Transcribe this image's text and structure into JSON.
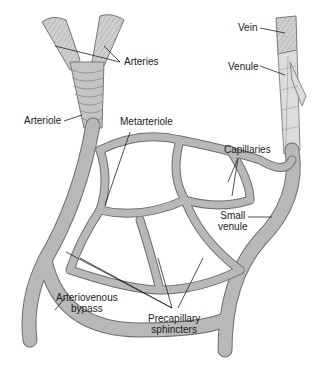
{
  "diagram": {
    "labels": {
      "arteries": "Arteries",
      "arteriole": "Arteriole",
      "metarteriole": "Metarteriole",
      "vein": "Vein",
      "venule": "Venule",
      "capillaries": "Capillaries",
      "small_venule_1": "Small",
      "small_venule_2": "venule",
      "av_bypass_1": "Arteriovenous",
      "av_bypass_2": "bypass",
      "precap_1": "Precapillary",
      "precap_2": "sphincters"
    },
    "colors": {
      "vessel_fill": "#b8b8b8",
      "vessel_edge": "#6e6e6e",
      "artery_fill": "#c8c8c8",
      "text": "#1a1a1a",
      "leader": "#222222"
    }
  }
}
